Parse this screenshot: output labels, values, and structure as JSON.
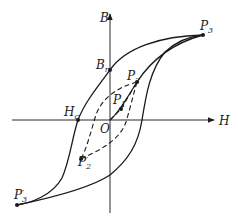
{
  "figure": {
    "axes": {
      "x_label": "H",
      "y_label": "B",
      "origin_label": "O"
    },
    "points": [
      {
        "id": "P3",
        "label": "P",
        "sub": "3",
        "x": 203,
        "y": 35
      },
      {
        "id": "Br",
        "label": "B",
        "sub": "r",
        "x": 110,
        "y": 70
      },
      {
        "id": "P2",
        "label": "P",
        "sub": "2",
        "x": 137,
        "y": 82
      },
      {
        "id": "P1",
        "label": "P",
        "sub": "1",
        "x": 121,
        "y": 109
      },
      {
        "id": "Hc",
        "label": "H",
        "sub": "c",
        "x": 78,
        "y": 120
      },
      {
        "id": "P2prime",
        "label": "P",
        "sub": "2",
        "prime": "′",
        "x": 81,
        "y": 159
      },
      {
        "id": "P3prime",
        "label": "P",
        "sub": "3",
        "prime": "′",
        "x": 17,
        "y": 205
      }
    ],
    "colors": {
      "ink": "#1a1a1a",
      "background": "#ffffff"
    }
  }
}
